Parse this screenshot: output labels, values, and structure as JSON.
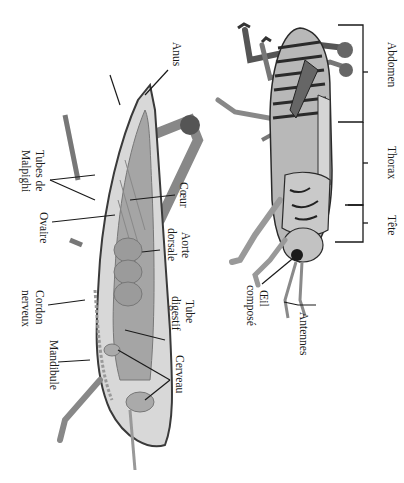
{
  "diagram": {
    "orientation": "rotated 90deg clockwise",
    "colors": {
      "background": "#ffffff",
      "ink": "#1a1a1a",
      "body_light": "#cfcfcf",
      "body_mid": "#9a9a9a",
      "body_dark": "#3a3a3a",
      "internal_organs": "#8c8c8c"
    },
    "external_view": {
      "segments": [
        {
          "label": "Abdomen"
        },
        {
          "label": "Thorax"
        },
        {
          "label": "Tête"
        }
      ],
      "labels": {
        "eye": [
          "Œil",
          "composé"
        ],
        "antennae": "Antennes"
      }
    },
    "internal_view": {
      "labels": {
        "anus": "Anus",
        "vagina": "Vagin",
        "malpighi": [
          "Tubes de",
          "Malpighi"
        ],
        "heart": "Cœur",
        "ovary": "Ovaire",
        "aorta": [
          "Aorte",
          "dorsale"
        ],
        "nerve_cord": [
          "Cordon",
          "nerveux"
        ],
        "gut": [
          "Tube",
          "digestif"
        ],
        "mandible": "Mandibule",
        "brain": "Cerveau"
      }
    }
  }
}
